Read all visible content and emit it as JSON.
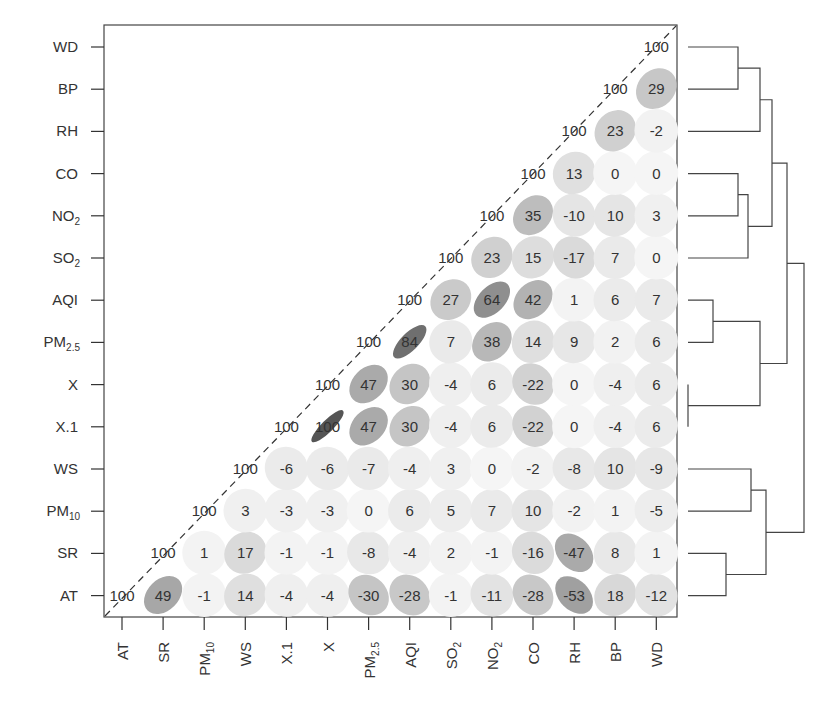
{
  "chart_data": {
    "type": "heatmap",
    "subtype": "correlation-matrix-ellipse-upper-triangle",
    "title": "",
    "variables": [
      "AT",
      "SR",
      "PM10",
      "WS",
      "X.1",
      "X",
      "PM2.5",
      "AQI",
      "SO2",
      "NO2",
      "CO",
      "RH",
      "BP",
      "WD"
    ],
    "x_tick_labels": [
      {
        "base": "AT",
        "sub": ""
      },
      {
        "base": "SR",
        "sub": ""
      },
      {
        "base": "PM",
        "sub": "10"
      },
      {
        "base": "WS",
        "sub": ""
      },
      {
        "base": "X.1",
        "sub": ""
      },
      {
        "base": "X",
        "sub": ""
      },
      {
        "base": "PM",
        "sub": "2.5"
      },
      {
        "base": "AQI",
        "sub": ""
      },
      {
        "base": "SO",
        "sub": "2"
      },
      {
        "base": "NO",
        "sub": "2"
      },
      {
        "base": "CO",
        "sub": ""
      },
      {
        "base": "RH",
        "sub": ""
      },
      {
        "base": "BP",
        "sub": ""
      },
      {
        "base": "WD",
        "sub": ""
      }
    ],
    "y_tick_labels_top_to_bottom": [
      {
        "base": "WD",
        "sub": ""
      },
      {
        "base": "BP",
        "sub": ""
      },
      {
        "base": "RH",
        "sub": ""
      },
      {
        "base": "CO",
        "sub": ""
      },
      {
        "base": "NO",
        "sub": "2"
      },
      {
        "base": "SO",
        "sub": "2"
      },
      {
        "base": "AQI",
        "sub": ""
      },
      {
        "base": "PM",
        "sub": "2.5"
      },
      {
        "base": "X",
        "sub": ""
      },
      {
        "base": "X.1",
        "sub": ""
      },
      {
        "base": "WS",
        "sub": ""
      },
      {
        "base": "PM",
        "sub": "10"
      },
      {
        "base": "SR",
        "sub": ""
      },
      {
        "base": "AT",
        "sub": ""
      }
    ],
    "value_scale": "correlation x 100",
    "matrix_order": "rows and columns follow 'variables' order (AT first); upper triangle shown, null = not drawn",
    "matrix": [
      [
        100,
        49,
        -1,
        14,
        -4,
        -4,
        -30,
        -28,
        -1,
        -11,
        -28,
        -53,
        18,
        -12
      ],
      [
        null,
        100,
        1,
        17,
        -1,
        -1,
        -8,
        -4,
        2,
        -1,
        -16,
        -47,
        8,
        1
      ],
      [
        null,
        null,
        100,
        3,
        -3,
        -3,
        0,
        6,
        5,
        7,
        10,
        -2,
        1,
        -5
      ],
      [
        null,
        null,
        null,
        100,
        -6,
        -6,
        -7,
        -4,
        3,
        0,
        -2,
        -8,
        10,
        -9
      ],
      [
        null,
        null,
        null,
        null,
        100,
        100,
        47,
        30,
        -4,
        6,
        -22,
        0,
        -4,
        6
      ],
      [
        null,
        null,
        null,
        null,
        null,
        100,
        47,
        30,
        -4,
        6,
        -22,
        0,
        -4,
        6
      ],
      [
        null,
        null,
        null,
        null,
        null,
        null,
        100,
        84,
        7,
        38,
        14,
        9,
        2,
        6
      ],
      [
        null,
        null,
        null,
        null,
        null,
        null,
        null,
        100,
        27,
        64,
        42,
        1,
        6,
        7
      ],
      [
        null,
        null,
        null,
        null,
        null,
        null,
        null,
        null,
        100,
        23,
        15,
        -17,
        7,
        0
      ],
      [
        null,
        null,
        null,
        null,
        null,
        null,
        null,
        null,
        null,
        100,
        35,
        -10,
        10,
        3
      ],
      [
        null,
        null,
        null,
        null,
        null,
        null,
        null,
        null,
        null,
        null,
        100,
        13,
        0,
        0
      ],
      [
        null,
        null,
        null,
        null,
        null,
        null,
        null,
        null,
        null,
        null,
        null,
        100,
        23,
        -2
      ],
      [
        null,
        null,
        null,
        null,
        null,
        null,
        null,
        null,
        null,
        null,
        null,
        null,
        100,
        29
      ],
      [
        null,
        null,
        null,
        null,
        null,
        null,
        null,
        null,
        null,
        null,
        null,
        null,
        null,
        100
      ]
    ],
    "diagonal_line": "dashed",
    "colormap": "grayscale ellipses; darker and narrower = stronger |r|",
    "dendrogram": {
      "position": "right",
      "leaf_order_top_to_bottom": [
        "WD",
        "BP",
        "RH",
        "CO",
        "NO2",
        "SO2",
        "AQI",
        "PM2.5",
        "X",
        "X.1",
        "WS",
        "PM10",
        "SR",
        "AT"
      ],
      "merges": [
        {
          "a": "X",
          "b": "X.1",
          "x": 689
        },
        {
          "a": "AQI",
          "b": "PM2.5",
          "x": 713
        },
        {
          "a": "SR",
          "b": "AT",
          "x": 726
        },
        {
          "a": "WD",
          "b": "BP",
          "x": 738
        },
        {
          "a": "CO",
          "b": "NO2",
          "x": 738
        },
        {
          "a": "CO+NO2",
          "b": "SO2",
          "x": 748
        },
        {
          "a": "WS",
          "b": "PM10",
          "x": 751
        },
        {
          "a": "WD+BP",
          "b": "RH",
          "x": 760
        },
        {
          "a": "AQI+PM2.5",
          "b": "X+X.1",
          "x": 760
        },
        {
          "a": "WS+PM10",
          "b": "SR+AT",
          "x": 766
        },
        {
          "a": "WD+BP+RH",
          "b": "CO+NO2+SO2",
          "x": 772
        },
        {
          "a": "upper-six",
          "b": "AQI+PM2.5+X+X.1",
          "x": 787
        },
        {
          "a": "upper-ten",
          "b": "lower-four",
          "x": 804
        }
      ]
    },
    "legend": "none",
    "grid": false
  }
}
